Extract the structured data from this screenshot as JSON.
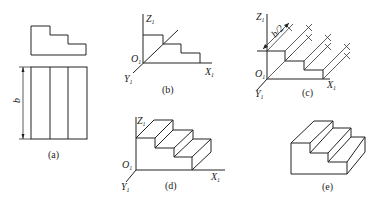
{
  "figure": {
    "panels": [
      {
        "id": "a",
        "caption": "(a)",
        "dimension_label": "b",
        "description": "front view (stepped profile) and top view (three strips) with dimension b"
      },
      {
        "id": "b",
        "caption": "(b)",
        "axes": {
          "z": "Z",
          "x": "X",
          "y": "Y",
          "origin": "O",
          "subscript": "1"
        },
        "description": "step profile drawn on X1-Z1 plane"
      },
      {
        "id": "c",
        "caption": "(c)",
        "axes": {
          "z": "Z",
          "x": "X",
          "y": "Y",
          "origin": "O",
          "subscript": "1"
        },
        "dimension_label": "b/2",
        "description": "receding parallel lines from each vertex along Y1, length b/2"
      },
      {
        "id": "d",
        "caption": "(d)",
        "axes": {
          "z": "Z",
          "x": "X",
          "y": "Y",
          "origin": "O",
          "subscript": "1"
        },
        "description": "completed oblique stairs with axes"
      },
      {
        "id": "e",
        "caption": "(e)",
        "description": "final oblique drawing of stairs"
      }
    ]
  }
}
